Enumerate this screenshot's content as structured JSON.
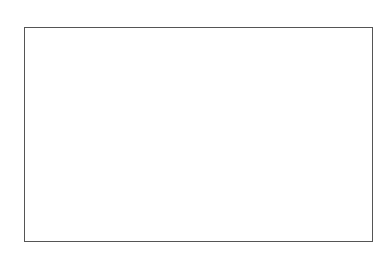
{
  "chart_data": {
    "type": "heatmap",
    "xlabel": "",
    "ylabel": "",
    "x_ticks": [
      "1",
      "2",
      "3",
      "4",
      "5",
      "6",
      "7",
      "8",
      "9",
      "10"
    ],
    "y_ticks": [
      "1",
      "2",
      "3",
      "4",
      "5",
      "6",
      "7",
      "8",
      "9",
      "10"
    ],
    "colormap": "gray",
    "grid": false,
    "legend": "none",
    "cell_colors": [
      [
        "#434343",
        "#434343",
        "#666666",
        "#434343",
        "#c0c0c0",
        "#434343",
        "#434343",
        "#6a6a6a",
        "#434343",
        "#434343"
      ],
      [
        "#434343",
        "#434343",
        "#e6e6e6",
        "#434343",
        "#7a7a7a",
        "#434343",
        "#6e6e6e",
        "#434343",
        "#434343",
        "#434343"
      ],
      [
        "#cfcfcf",
        "#434343",
        "#434343",
        "#858585",
        "#434343",
        "#434343",
        "#434343",
        "#434343",
        "#434343",
        "#434343"
      ],
      [
        "#434343",
        "#434343",
        "#dedede",
        "#434343",
        "#d8d8d8",
        "#434343",
        "#434343",
        "#434343",
        "#434343",
        "#434343"
      ],
      [
        "#434343",
        "#434343",
        "#d0d0d0",
        "#d0d0d0",
        "#d0d0d0",
        "#434343",
        "#434343",
        "#434343",
        "#434343",
        "#8a8a8a"
      ],
      [
        "#8a8a8a",
        "#d2d2d2",
        "#434343",
        "#434343",
        "#434343",
        "#c8c8c8",
        "#434343",
        "#d6d6d6",
        "#737373",
        "#444444"
      ],
      [
        "#595959",
        "#d2d2d2",
        "#434343",
        "#434343",
        "#434343",
        "#434343",
        "#636363",
        "#434343",
        "#555555",
        "#606060"
      ],
      [
        "#404040",
        "#d0d0d0",
        "#8e8e8e",
        "#434343",
        "#434343",
        "#d0d0d0",
        "#434343",
        "#434343",
        "#4a4a4a",
        "#4f4f4f"
      ],
      [
        "#555555",
        "#bcbcbc",
        "#434343",
        "#434343",
        "#434343",
        "#5f5f5f",
        "#434343",
        "#434343",
        "#4a4a4a",
        "#6e6e6e"
      ],
      [
        "#555555",
        "#8e8e8e",
        "#434343",
        "#434343",
        "#555555",
        "#555555",
        "#434343",
        "#434343",
        "#666666",
        "#aaaaaa"
      ]
    ]
  }
}
